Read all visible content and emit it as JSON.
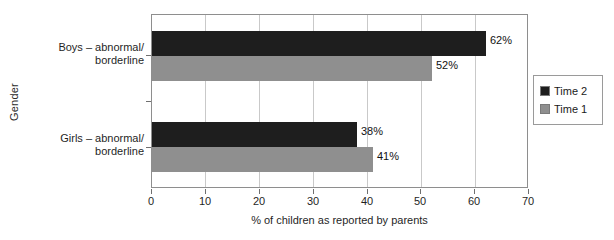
{
  "chart_data": {
    "type": "bar",
    "orientation": "horizontal",
    "title": "",
    "xlabel": "% of children as reported by parents",
    "ylabel": "Gender",
    "categories": [
      "Boys – abnormal/ borderline",
      "Girls – abnormal/ borderline"
    ],
    "category_lines": [
      [
        "Boys – abnormal/",
        "borderline"
      ],
      [
        "Girls – abnormal/",
        "borderline"
      ]
    ],
    "series": [
      {
        "name": "Time 2",
        "color": "#1e1e1e",
        "values": [
          62,
          38
        ],
        "labels": [
          "62%",
          "38%"
        ]
      },
      {
        "name": "Time 1",
        "color": "#8f8f8f",
        "values": [
          52,
          41
        ],
        "labels": [
          "52%",
          "41%"
        ]
      }
    ],
    "xlim": [
      0,
      70
    ],
    "xticks": [
      0,
      10,
      20,
      30,
      40,
      50,
      60,
      70
    ],
    "xtick_labels": [
      "0",
      "10",
      "20",
      "30",
      "40",
      "50",
      "60",
      "70"
    ],
    "grid": true,
    "grid_axis": "x",
    "legend_position": "right"
  },
  "legend": {
    "entries": [
      {
        "label": "Time 2"
      },
      {
        "label": "Time 1"
      }
    ]
  }
}
